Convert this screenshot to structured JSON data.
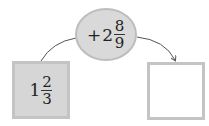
{
  "operation": {
    "operator": "+",
    "whole": "2",
    "numerator": "8",
    "denominator": "9"
  },
  "input": {
    "whole": "1",
    "numerator": "2",
    "denominator": "3"
  },
  "output": {
    "value": ""
  },
  "colors": {
    "shaded_fill": "#d6d6d6",
    "border": "#c4c4c4",
    "arrow": "#555555"
  }
}
